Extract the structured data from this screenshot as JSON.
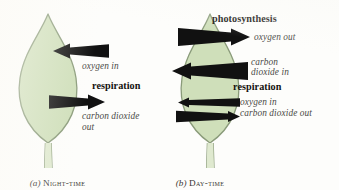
{
  "figure": {
    "background_color": "#fdfdfb",
    "leaf_fill": "#cfdfba",
    "leaf_outline": "#8a9b7a",
    "arrow_color": "#111111",
    "label_color": "#4a4a46",
    "heading_color": "#14120f"
  },
  "panels": [
    {
      "id": "night",
      "caption_letter": "(a)",
      "caption_text": "Night-time",
      "process_heading": "respiration",
      "arrows": [
        {
          "name": "oxygen-in-arrow",
          "direction": "left",
          "size": "large",
          "label": "oxygen in"
        },
        {
          "name": "carbon-dioxide-out-arrow",
          "direction": "right",
          "size": "large",
          "label": "carbon dioxide\nout"
        }
      ],
      "labels": [
        {
          "name": "oxygen-in-label",
          "text": "oxygen in"
        },
        {
          "name": "respiration-heading",
          "text": "respiration"
        },
        {
          "name": "carbon-dioxide-out-label-line1",
          "text": "carbon dioxide"
        },
        {
          "name": "carbon-dioxide-out-label-line2",
          "text": "out"
        }
      ]
    },
    {
      "id": "day",
      "caption_letter": "(b)",
      "caption_text": "Day-time",
      "process_heading_1": "photosynthesis",
      "process_heading_2": "respiration",
      "arrows": [
        {
          "name": "oxygen-out-arrow",
          "direction": "right",
          "size": "large",
          "label": "oxygen out"
        },
        {
          "name": "carbon-dioxide-in-arrow",
          "direction": "left",
          "size": "large",
          "label": "carbon dioxide in"
        },
        {
          "name": "oxygen-in-arrow",
          "direction": "left",
          "size": "small",
          "label": "oxygen in"
        },
        {
          "name": "carbon-dioxide-out-arrow",
          "direction": "right",
          "size": "small",
          "label": "carbon dioxide out"
        }
      ],
      "labels": [
        {
          "name": "photosynthesis-heading",
          "text": "photosynthesis"
        },
        {
          "name": "oxygen-out-label",
          "text": "oxygen out"
        },
        {
          "name": "carbon-dioxide-in-label-line1",
          "text": "carbon"
        },
        {
          "name": "carbon-dioxide-in-label-line2",
          "text": "dioxide in"
        },
        {
          "name": "respiration-heading",
          "text": "respiration"
        },
        {
          "name": "oxygen-in-label",
          "text": "oxygen in"
        },
        {
          "name": "carbon-dioxide-out-label",
          "text": "carbon dioxide out"
        }
      ]
    }
  ],
  "night": {
    "oxygen_in": "oxygen in",
    "respiration": "respiration",
    "co2_out_line1": "carbon dioxide",
    "co2_out_line2": "out",
    "caption_letter": "(a)",
    "caption_label": "Night-time"
  },
  "day": {
    "photosynthesis": "photosynthesis",
    "oxygen_out": "oxygen out",
    "co2_in_line1": "carbon",
    "co2_in_line2": "dioxide in",
    "respiration": "respiration",
    "oxygen_in": "oxygen in",
    "co2_out": "carbon dioxide out",
    "caption_letter": "(b)",
    "caption_label": "Day-time"
  }
}
